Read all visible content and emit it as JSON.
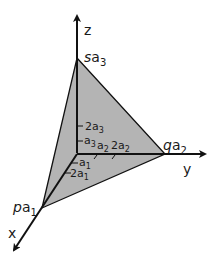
{
  "diagram": {
    "title": "",
    "axes": {
      "x": {
        "label": "x"
      },
      "y": {
        "label": "y"
      },
      "z": {
        "label": "z"
      }
    },
    "vertices": {
      "x_intercept": {
        "coef": "p",
        "sub_base": "a",
        "sub": "1"
      },
      "y_intercept": {
        "coef": "q",
        "sub_base": "a",
        "sub": "2"
      },
      "z_intercept": {
        "coef": "s",
        "sub_base": "a",
        "sub": "3"
      }
    },
    "ticks": {
      "x": [
        {
          "coef": "",
          "base": "a",
          "sub": "1"
        },
        {
          "coef": "2",
          "base": "a",
          "sub": "1"
        }
      ],
      "y": [
        {
          "coef": "",
          "base": "a",
          "sub": "2"
        },
        {
          "coef": "2",
          "base": "a",
          "sub": "2"
        }
      ],
      "z": [
        {
          "coef": "",
          "base": "a",
          "sub": "3"
        },
        {
          "coef": "2",
          "base": "a",
          "sub": "3"
        }
      ]
    },
    "colors": {
      "plane_fill": "#b4b4b4",
      "line": "#111111"
    }
  }
}
